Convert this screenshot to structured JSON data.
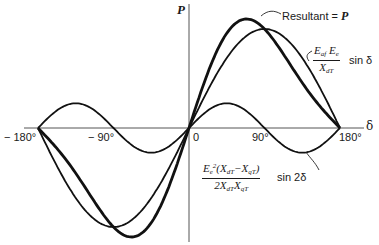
{
  "chart_data": {
    "type": "line",
    "title": "",
    "xlabel": "δ",
    "ylabel": "P",
    "xlim": [
      -180,
      180
    ],
    "x_ticks": [
      "-180°",
      "-90°",
      "0",
      "90°",
      "180°"
    ],
    "grid": false,
    "legend": "inline annotations",
    "series": [
      {
        "name": "Resultant = P",
        "formula": "A·sin δ + B·sin 2δ",
        "line_width": "thick",
        "x": [
          -180,
          -150,
          -120,
          -90,
          -60,
          -48,
          -30,
          0,
          30,
          48,
          60,
          90,
          120,
          150,
          180
        ],
        "y": [
          0,
          -0.73,
          -1.08,
          -1.0,
          -1.08,
          -1.12,
          -0.73,
          0,
          0.73,
          1.12,
          1.08,
          1.0,
          0.64,
          0.27,
          0
        ]
      },
      {
        "name": "E_af E_e / X_dT · sin δ",
        "formula": "A·sin δ",
        "line_width": "medium",
        "x": [
          -180,
          -150,
          -120,
          -90,
          -60,
          -30,
          0,
          30,
          60,
          90,
          120,
          150,
          180
        ],
        "y": [
          0,
          -0.5,
          -0.87,
          -1.0,
          -0.87,
          -0.5,
          0,
          0.5,
          0.87,
          1.0,
          0.87,
          0.5,
          0
        ]
      },
      {
        "name": "E_e²(X_dT − X_qT) / (2 X_dT X_qT) · sin 2δ",
        "formula": "B·sin 2δ",
        "line_width": "medium",
        "x": [
          -180,
          -135,
          -90,
          -45,
          0,
          45,
          90,
          135,
          180
        ],
        "y": [
          0,
          0.25,
          0,
          -0.25,
          0,
          0.25,
          0,
          -0.25,
          0
        ]
      }
    ],
    "amplitudes": {
      "A_sin_delta": 1.0,
      "B_sin_2delta": 0.25
    }
  },
  "labels": {
    "y_axis": "P",
    "x_axis": "δ",
    "ticks": {
      "m180": "− 180°",
      "m90": "− 90°",
      "zero": "0",
      "p90": "90°",
      "p180": "180°"
    },
    "resultant": "Resultant = ",
    "resultant_var": "P",
    "sin_delta_num": "E",
    "sin_delta_text": "sin δ",
    "sin2_text": "sin 2δ"
  }
}
